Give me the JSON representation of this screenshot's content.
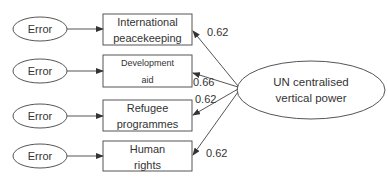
{
  "diagram": {
    "errors": [
      {
        "label": "Error"
      },
      {
        "label": "Error"
      },
      {
        "label": "Error"
      },
      {
        "label": "Error"
      }
    ],
    "indicators": [
      {
        "line1": "International",
        "line2": "peacekeeping"
      },
      {
        "line1": "Development",
        "line2": "aid"
      },
      {
        "line1": "Refugee",
        "line2": "programmes"
      },
      {
        "line1": "Human",
        "line2": "rights"
      }
    ],
    "latent": {
      "line1": "UN centralised",
      "line2": "vertical power"
    },
    "loadings": [
      "0.62",
      "0.66",
      "0.62",
      "0.62"
    ],
    "colors": {
      "stroke": "#555555",
      "text": "#333333",
      "background": "#ffffff"
    }
  }
}
